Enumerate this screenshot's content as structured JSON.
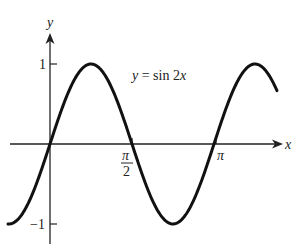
{
  "chart_data": {
    "type": "line",
    "title": "",
    "equation_label": "y = sin 2x",
    "xlabel": "x",
    "ylabel": "y",
    "function": "sin(2x)",
    "x_range": [
      -0.256,
      1.384
    ],
    "x_range_units": "multiples of pi",
    "ylim": [
      -1,
      1
    ],
    "x_ticks": [
      {
        "value": "pi/2",
        "label_num": "π",
        "label_den": "2"
      },
      {
        "value": "pi",
        "label": "π"
      }
    ],
    "y_ticks": [
      {
        "value": 1,
        "label": "1"
      },
      {
        "value": -1,
        "label": "−1"
      }
    ],
    "series": [
      {
        "name": "y = sin 2x",
        "x": [
          -0.25,
          0,
          0.125,
          0.25,
          0.375,
          0.5,
          0.625,
          0.75,
          0.875,
          1.0,
          1.125,
          1.25,
          1.375
        ],
        "x_units": "pi",
        "values": [
          -1,
          0,
          0.707,
          1,
          0.707,
          0,
          -0.707,
          -1,
          -0.707,
          0,
          0.707,
          1,
          0.707
        ]
      }
    ],
    "grid": false,
    "legend": "none"
  },
  "labels": {
    "y_axis": "y",
    "x_axis": "x",
    "equation_y": "y",
    "equation_rest": " = sin 2",
    "equation_x": "x",
    "tick_one": "1",
    "tick_neg_one": "−1",
    "tick_pi_half_num": "π",
    "tick_pi_half_den": "2",
    "tick_pi": "π"
  },
  "colors": {
    "curve": "#111111",
    "axis": "#222222",
    "background": "#ffffff"
  }
}
